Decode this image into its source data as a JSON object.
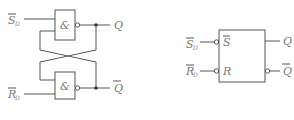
{
  "diagram": {
    "left_circuit": {
      "inputs": [
        {
          "label": "S",
          "subscript": "D",
          "overbar": true
        },
        {
          "label": "R",
          "subscript": "D",
          "overbar": true
        }
      ],
      "gates": [
        {
          "symbol": "&",
          "type": "NAND"
        },
        {
          "symbol": "&",
          "type": "NAND"
        }
      ],
      "outputs": [
        {
          "label": "Q",
          "overbar": false
        },
        {
          "label": "Q",
          "overbar": true
        }
      ]
    },
    "right_symbol": {
      "inputs": [
        {
          "label": "S",
          "subscript": "D",
          "overbar": true,
          "pin": "S"
        },
        {
          "label": "R",
          "subscript": "D",
          "overbar": true,
          "pin": "R"
        }
      ],
      "outputs": [
        {
          "label": "Q",
          "overbar": false
        },
        {
          "label": "Q",
          "overbar": true
        }
      ]
    }
  }
}
